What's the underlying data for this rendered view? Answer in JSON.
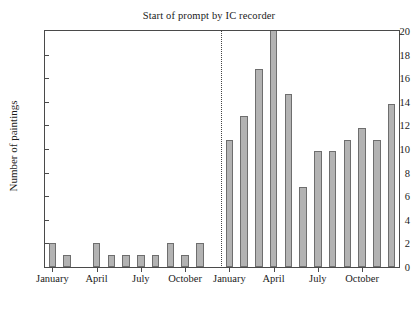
{
  "chart_data": {
    "type": "bar",
    "title": "Start of prompt by IC recorder",
    "xlabel": "",
    "ylabel": "Number of paintings",
    "ylim": [
      0,
      20
    ],
    "ytick_values": [
      0,
      2,
      4,
      6,
      8,
      10,
      12,
      14,
      16,
      18,
      20
    ],
    "ytick_labels": [
      "0",
      "2",
      "4",
      "6",
      "8",
      "10",
      "12",
      "14",
      "16",
      "18",
      "20"
    ],
    "grid": false,
    "legend": null,
    "annotations": [
      {
        "name": "start-of-prompt-divider",
        "type": "vline",
        "style": "dotted",
        "at_category_index": 11,
        "description": "Start of prompt by IC recorder"
      }
    ],
    "note": "Bar at index 15 is clipped by the y-axis maximum of 20",
    "categories": [
      "January",
      "February",
      "March",
      "April",
      "May",
      "June",
      "July",
      "August",
      "September",
      "October",
      "November",
      "December",
      "January",
      "February",
      "March",
      "April",
      "May",
      "June",
      "July",
      "August",
      "September",
      "October",
      "November",
      "December"
    ],
    "values": [
      2,
      1,
      0,
      2,
      1,
      1,
      1,
      1,
      2,
      1,
      2,
      0,
      10.8,
      12.8,
      16.8,
      20,
      14.7,
      6.8,
      9.8,
      9.8,
      10.8,
      11.8,
      10.8,
      13.8
    ],
    "xtick_labels": [
      "January",
      "April",
      "July",
      "October",
      "January",
      "April",
      "July",
      "October"
    ],
    "xtick_category_indices": [
      0,
      3,
      6,
      9,
      12,
      15,
      18,
      21
    ]
  },
  "style": {
    "bar_fill": "#b3b3b3",
    "bar_edge": "#6e6e6e",
    "axis_color": "#4a4a4a",
    "text_color": "#1a1a1a",
    "background": "#ffffff"
  }
}
